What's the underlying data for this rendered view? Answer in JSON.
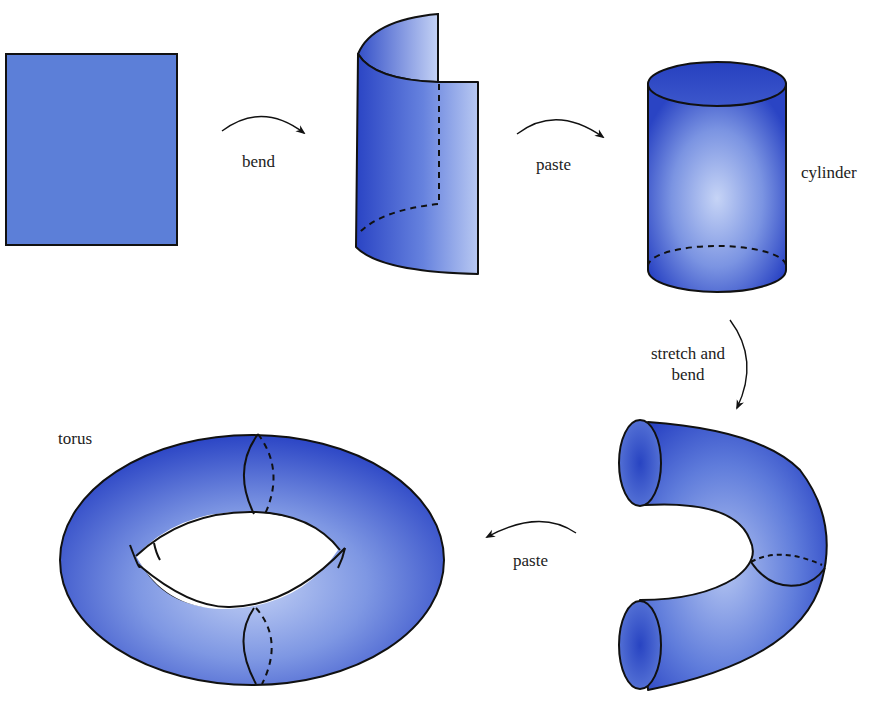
{
  "colors": {
    "surface_dark": "#2c47c6",
    "surface_light": "#b9c8f2",
    "square_fill": "#5c7fd8",
    "outline": "#111111",
    "text": "#222222"
  },
  "steps": [
    {
      "id": "square",
      "label": ""
    },
    {
      "id": "bend",
      "label": "bend"
    },
    {
      "id": "paste_1",
      "label": "paste"
    },
    {
      "id": "cylinder",
      "label": "cylinder"
    },
    {
      "id": "stretch_and_bend",
      "label_line1": "stretch and",
      "label_line2": "bend"
    },
    {
      "id": "paste_2",
      "label": "paste"
    },
    {
      "id": "torus",
      "label": "torus"
    }
  ],
  "labels": {
    "bend": "bend",
    "paste_top": "paste",
    "cylinder": "cylinder",
    "stretch_line1": "stretch and",
    "stretch_line2": "bend",
    "paste_bottom": "paste",
    "torus": "torus"
  }
}
